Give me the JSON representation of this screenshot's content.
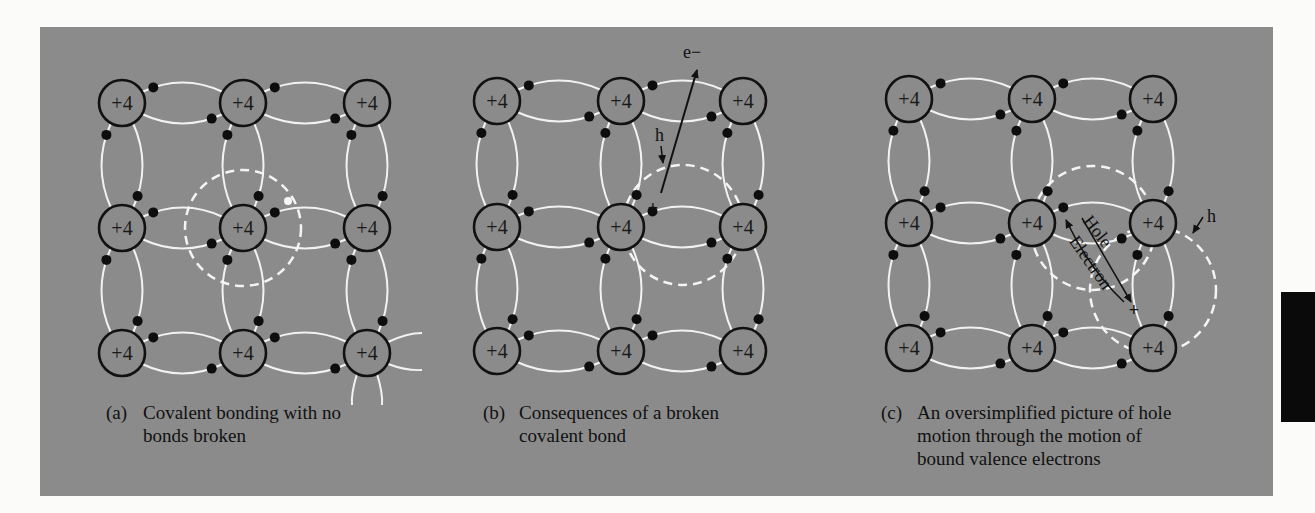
{
  "colors": {
    "page_bg": "#fbfbfa",
    "panel_bg": "#8b8b8b",
    "bond": "#f2f2f2",
    "dashed": "#f4f4f4",
    "atom_stroke": "#111111",
    "electron": "#0d0d0d",
    "tab": "#0a0a0a"
  },
  "atom_charge_label": "+4",
  "panels": [
    {
      "id": "a",
      "grid": {
        "xs": [
          122,
          243,
          367
        ],
        "ys": [
          103,
          228,
          353
        ]
      },
      "dashed_circles": [
        {
          "cx": 243,
          "cy": 228,
          "r": 58
        }
      ],
      "broken_marker": {
        "x": 288,
        "y": 201
      },
      "extra_stub_atom": {
        "col": 2,
        "row": 2
      },
      "caption": {
        "tag": "(a)",
        "lines": [
          "Covalent bonding with no",
          "bonds broken"
        ],
        "x": 106,
        "y": 401,
        "indent": 37
      }
    },
    {
      "id": "b",
      "grid": {
        "xs": [
          497,
          621,
          743
        ],
        "ys": [
          101,
          227,
          351
        ]
      },
      "dashed_circles": [
        {
          "cx": 683,
          "cy": 225,
          "r": 60
        }
      ],
      "plus": {
        "x": 653,
        "y": 208,
        "text": "+"
      },
      "electron_arrow": {
        "x1": 661,
        "y1": 193,
        "x2": 697,
        "y2": 70,
        "label": "e−",
        "lx": 683,
        "ly": 58
      },
      "hole_arrow": {
        "label": "h",
        "lx": 655,
        "ly": 141,
        "x1": 661,
        "y1": 146,
        "x2": 663,
        "y2": 163
      },
      "caption": {
        "tag": "(b)",
        "lines": [
          "Consequences of a broken",
          "covalent bond"
        ],
        "x": 483,
        "y": 401,
        "indent": 36
      }
    },
    {
      "id": "c",
      "grid": {
        "xs": [
          909,
          1032,
          1153
        ],
        "ys": [
          99,
          223,
          348
        ]
      },
      "dashed_circles": [
        {
          "cx": 1093,
          "cy": 228,
          "r": 62
        },
        {
          "cx": 1153,
          "cy": 290,
          "r": 63
        }
      ],
      "plus": {
        "x": 1134,
        "y": 310,
        "text": "+"
      },
      "hole_label": "Hole",
      "electron_label": "Electron",
      "hole_arrow_h": {
        "label": "h",
        "lx": 1207,
        "ly": 222,
        "x1": 1203,
        "y1": 217,
        "x2": 1193,
        "y2": 233
      },
      "caption": {
        "tag": "(c)",
        "lines": [
          "An oversimplified picture of hole",
          "motion through the motion of",
          "bound valence electrons"
        ],
        "x": 881,
        "y": 401,
        "indent": 36
      }
    }
  ]
}
